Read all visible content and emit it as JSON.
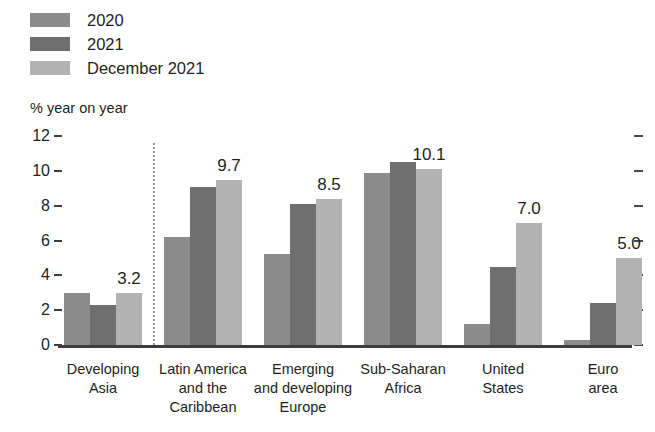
{
  "legend": {
    "items": [
      {
        "label": "2020",
        "color": "#8c8c8c"
      },
      {
        "label": "2021",
        "color": "#6f6f6f"
      },
      {
        "label": "December 2021",
        "color": "#b3b3b3"
      }
    ]
  },
  "chart_data": {
    "type": "bar",
    "title": "",
    "subtitle": "",
    "xlabel": "",
    "ylabel": "% year on year",
    "ylim": [
      0,
      12
    ],
    "yticks": [
      0,
      2,
      4,
      6,
      8,
      10,
      12
    ],
    "grid": false,
    "legend_position": "top-left",
    "categories": [
      "Developing Asia",
      "Latin America and the Caribbean",
      "Emerging and developing Europe",
      "Sub-Saharan Africa",
      "United States",
      "Euro area"
    ],
    "category_lines": [
      [
        "Developing",
        "Asia"
      ],
      [
        "Latin America",
        "and the",
        "Caribbean"
      ],
      [
        "Emerging",
        "and developing",
        "Europe"
      ],
      [
        "Sub-Saharan",
        "Africa"
      ],
      [
        "United",
        "States"
      ],
      [
        "Euro area"
      ]
    ],
    "series": [
      {
        "name": "2020",
        "color": "#8c8c8c",
        "values": [
          3.0,
          6.2,
          5.2,
          9.9,
          1.2,
          0.3
        ]
      },
      {
        "name": "2021",
        "color": "#6f6f6f",
        "values": [
          2.3,
          9.1,
          8.1,
          10.5,
          4.5,
          2.4
        ]
      },
      {
        "name": "December 2021",
        "color": "#b3b3b3",
        "values": [
          3.0,
          9.5,
          8.4,
          10.1,
          7.0,
          5.0
        ]
      }
    ],
    "data_labels": [
      {
        "category": "Developing Asia",
        "series": "December 2021",
        "text": "3.2"
      },
      {
        "category": "Latin America and the Caribbean",
        "series": "December 2021",
        "text": "9.7"
      },
      {
        "category": "Emerging and developing Europe",
        "series": "December 2021",
        "text": "8.5"
      },
      {
        "category": "Sub-Saharan Africa",
        "series": "December 2021",
        "text": "10.1"
      },
      {
        "category": "United States",
        "series": "December 2021",
        "text": "7.0"
      },
      {
        "category": "Euro area",
        "series": "December 2021",
        "text": "5.0"
      }
    ],
    "annotations": {
      "separator_after_category": "Developing Asia"
    },
    "axis_tick_side": "both"
  }
}
